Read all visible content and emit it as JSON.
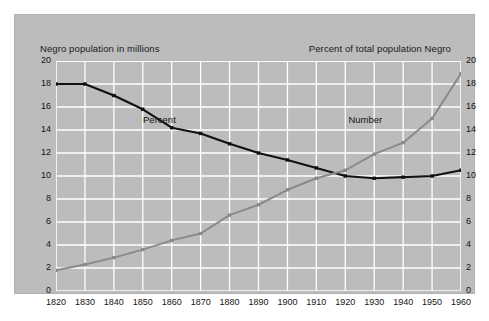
{
  "chart_data": {
    "type": "line",
    "title": "",
    "left_axis_title": "Negro population in millions",
    "right_axis_title": "Percent of total population Negro",
    "xlabel": "",
    "ylabel": "",
    "x": [
      1820,
      1830,
      1840,
      1850,
      1860,
      1870,
      1880,
      1890,
      1900,
      1910,
      1920,
      1930,
      1940,
      1950,
      1960
    ],
    "xticklabels": [
      "1820",
      "1830",
      "1840",
      "1850",
      "1860",
      "1870",
      "1880",
      "1890",
      "1900",
      "1910",
      "1920",
      "1930",
      "1940",
      "1950",
      "1960"
    ],
    "xlim": [
      1820,
      1960
    ],
    "ylim": [
      0,
      20
    ],
    "yticks": [
      0,
      2,
      4,
      6,
      8,
      10,
      12,
      14,
      16,
      18,
      20
    ],
    "yticklabels_left": [
      "0",
      "2",
      "4",
      "6",
      "8",
      "10",
      "12",
      "14",
      "16",
      "18",
      "20"
    ],
    "yticklabels_right": [
      "0",
      "2",
      "4",
      "6",
      "8",
      "10",
      "12",
      "14",
      "16",
      "18",
      "20"
    ],
    "grid": true,
    "grid_color": "#ffffff",
    "background_color": "#bcbcbc",
    "legend_position": "inline-labels",
    "series": [
      {
        "name": "Percent",
        "axis": "right",
        "color": "#111111",
        "marker": "square",
        "values": [
          18.0,
          18.0,
          17.0,
          15.8,
          14.2,
          13.7,
          12.8,
          12.0,
          11.4,
          10.7,
          10.0,
          9.8,
          9.9,
          10.0,
          10.5
        ],
        "label_x": 1857,
        "label_y": 14.9
      },
      {
        "name": "Number",
        "axis": "left",
        "color": "#8a8a8a",
        "marker": "square",
        "values": [
          1.8,
          2.3,
          2.9,
          3.6,
          4.4,
          5.0,
          6.6,
          7.5,
          8.8,
          9.8,
          10.5,
          11.9,
          12.9,
          15.0,
          18.9
        ],
        "label_x": 1928,
        "label_y": 14.9
      }
    ]
  }
}
